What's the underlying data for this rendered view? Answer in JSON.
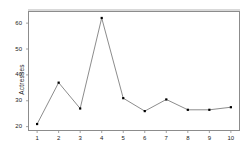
{
  "chart_data": {
    "type": "line",
    "title": "",
    "subtitle": "",
    "xlabel": "",
    "ylabel": "Actresses",
    "x": [
      1,
      2,
      3,
      4,
      5,
      6,
      7,
      8,
      9,
      10
    ],
    "categories": [
      "1",
      "2",
      "3",
      "4",
      "5",
      "6",
      "7",
      "8",
      "9",
      "10"
    ],
    "values": [
      21,
      37,
      27,
      62,
      31,
      26,
      30.5,
      26.5,
      26.5,
      27.5
    ],
    "series": [
      {
        "name": "Actresses",
        "values": [
          21,
          37,
          27,
          62,
          31,
          26,
          30.5,
          26.5,
          26.5,
          27.5
        ],
        "marker": "filled-square",
        "color": "#000000",
        "line_color": "#6e6e6e"
      }
    ],
    "xlim": [
      0.6,
      10.4
    ],
    "ylim": [
      18.5,
      64.5
    ],
    "yticks": [
      20,
      30,
      40,
      50,
      60
    ],
    "ytick_labels": [
      "20",
      "30",
      "40",
      "50",
      "60"
    ],
    "xticks": [
      1,
      2,
      3,
      4,
      5,
      6,
      7,
      8,
      9,
      10
    ],
    "xtick_labels": [
      "1",
      "2",
      "3",
      "4",
      "5",
      "6",
      "7",
      "8",
      "9",
      "10"
    ],
    "grid": false,
    "legend": false,
    "legend_position": "none",
    "frame": true,
    "annotations": []
  },
  "colors": {
    "line": "#6e6e6e",
    "marker": "#000000",
    "axis": "#8c8c8c",
    "text": "#1a1a1a",
    "background": "#ffffff"
  }
}
